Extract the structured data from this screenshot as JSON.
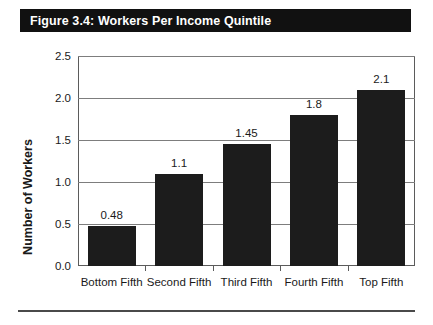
{
  "figure": {
    "title": "Figure 3.4: Workers Per Income Quintile",
    "title_band_color": "#111111",
    "title_text_color": "#ffffff"
  },
  "chart_data": {
    "type": "bar",
    "title": "Figure 3.4: Workers Per Income Quintile",
    "xlabel": "",
    "ylabel": "Number of Workers",
    "categories": [
      "Bottom Fifth",
      "Second Fifth",
      "Third Fifth",
      "Fourth Fifth",
      "Top Fifth"
    ],
    "values": [
      0.48,
      1.1,
      1.45,
      1.8,
      2.1
    ],
    "value_labels": [
      "0.48",
      "1.1",
      "1.45",
      "1.8",
      "2.1"
    ],
    "ylim": [
      0.0,
      2.5
    ],
    "ytick_labels": [
      "0.0",
      "0.5",
      "1.0",
      "1.5",
      "2.0",
      "2.5"
    ],
    "ytick_values": [
      0.0,
      0.5,
      1.0,
      1.5,
      2.0,
      2.5
    ],
    "grid": true,
    "legend": false,
    "bar_color": "#1c1c1c",
    "grid_color": "#7d7d7d",
    "axis_color": "#5b5b5b"
  }
}
